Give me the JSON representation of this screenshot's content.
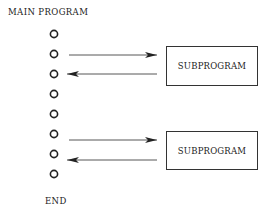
{
  "title": "MAIN PROGRAM",
  "end_label": "END",
  "steps": 8,
  "subprograms": [
    {
      "label": "SUBPROGRAM",
      "call_from_step": 2,
      "return_to_step": 3
    },
    {
      "label": "SUBPROGRAM",
      "call_from_step": 6,
      "return_to_step": 7
    }
  ]
}
